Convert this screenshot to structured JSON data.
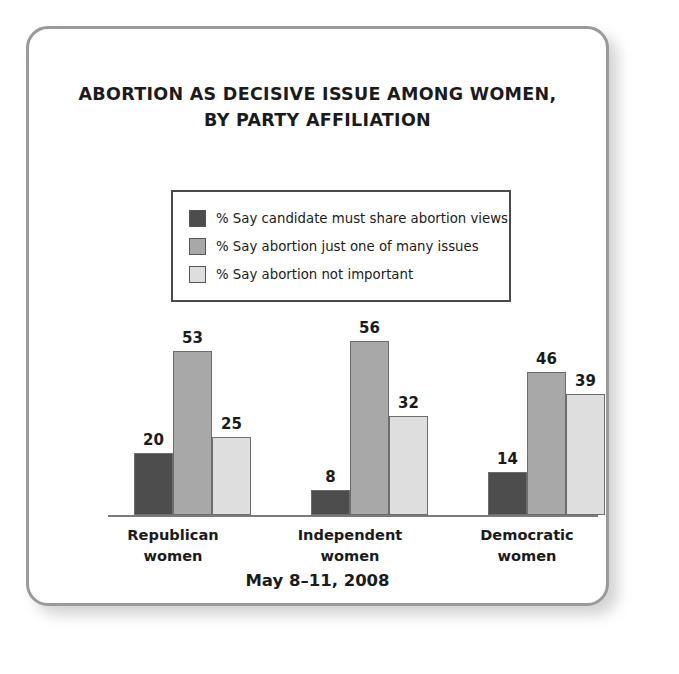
{
  "card": {
    "border_color": "#9a9a9a",
    "background": "#ffffff"
  },
  "title": {
    "line1": "ABORTION AS DECISIVE ISSUE AMONG WOMEN,",
    "line2": "BY PARTY AFFILIATION"
  },
  "footer": {
    "date": "May 8–11, 2008"
  },
  "chart_data": {
    "type": "bar",
    "title": "ABORTION AS DECISIVE ISSUE AMONG WOMEN, BY PARTY AFFILIATION",
    "subtitle": "May 8–11, 2008",
    "xlabel": "",
    "ylabel": "",
    "ylim": [
      0,
      60
    ],
    "grid": false,
    "legend_position": "top-center",
    "categories": [
      "Republican women",
      "Independent women",
      "Democratic women"
    ],
    "category_lines": [
      [
        "Republican",
        "women"
      ],
      [
        "Independent",
        "women"
      ],
      [
        "Democratic",
        "women"
      ]
    ],
    "series": [
      {
        "name": "% Say candidate must share abortion views",
        "color": "#4d4d4d",
        "values": [
          20,
          8,
          14
        ]
      },
      {
        "name": "% Say abortion just one of many issues",
        "color": "#a8a8a8",
        "values": [
          53,
          56,
          46
        ]
      },
      {
        "name": "% Say abortion not important",
        "color": "#dedede",
        "values": [
          25,
          32,
          39
        ]
      }
    ]
  }
}
